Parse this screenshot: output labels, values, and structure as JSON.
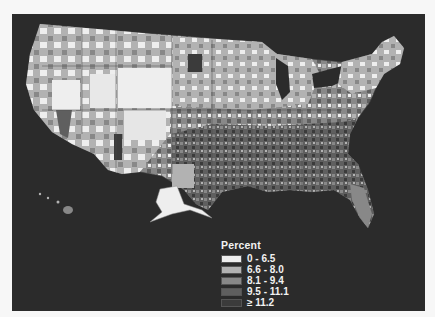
{
  "map": {
    "type": "choropleth",
    "region": "United States counties (including Alaska and Hawaii insets)",
    "background_color": "#2b2b2b",
    "page_background": "#f7f7f7"
  },
  "legend": {
    "title": "Percent",
    "items": [
      {
        "label": "0 - 6.5",
        "color": "#eeeeee"
      },
      {
        "label": "6.6 - 8.0",
        "color": "#b2b2b2"
      },
      {
        "label": "8.1 - 9.4",
        "color": "#888888"
      },
      {
        "label": "9.5 - 11.1",
        "color": "#5f5f5f"
      },
      {
        "label": "≥ 11.2",
        "color": "#3b3b3b"
      }
    ]
  }
}
